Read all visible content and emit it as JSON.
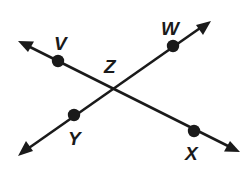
{
  "figure": {
    "type": "geometry-diagram",
    "background_color": "#ffffff",
    "stroke_color": "#1a1a1a",
    "width": 249,
    "height": 176
  },
  "labels": {
    "v": "V",
    "w": "W",
    "x": "X",
    "y": "Y",
    "z": "Z"
  },
  "points": [
    {
      "id": "v",
      "label": "V",
      "cx": 58,
      "cy": 61,
      "label_x": 54,
      "label_y": 50
    },
    {
      "id": "w",
      "label": "W",
      "cx": 173,
      "cy": 46,
      "label_x": 160,
      "label_y": 36
    },
    {
      "id": "z",
      "label": "Z",
      "cx": 114,
      "cy": 86,
      "label_x": 104,
      "label_y": 74
    },
    {
      "id": "y",
      "label": "Y",
      "cx": 74,
      "cy": 115,
      "label_x": 69,
      "label_y": 144
    },
    {
      "id": "x",
      "label": "X",
      "cx": 194,
      "cy": 131,
      "label_x": 184,
      "label_y": 160
    }
  ],
  "lines": [
    {
      "id": "line-vx",
      "name": "line-v-z-x",
      "through": [
        "V",
        "Z",
        "X"
      ],
      "x1": 26,
      "y1": 45,
      "x2": 232,
      "y2": 148,
      "arrows": [
        "start",
        "end"
      ]
    },
    {
      "id": "line-wy",
      "name": "line-y-z-w",
      "through": [
        "Y",
        "Z",
        "W"
      ],
      "x1": 203,
      "y1": 26,
      "x2": 26,
      "y2": 150,
      "arrows": [
        "start",
        "end"
      ]
    }
  ]
}
